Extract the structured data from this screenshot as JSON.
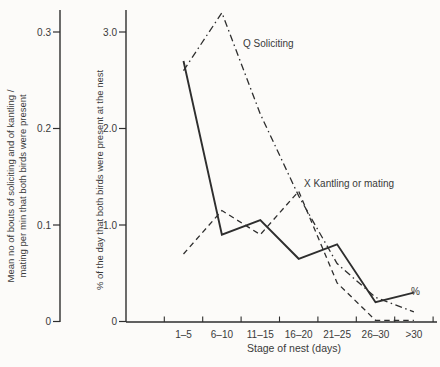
{
  "figure_title": "",
  "colors": {
    "ink": "#2e2e2e",
    "text": "#3a3a3a",
    "background": "#fcfbf9"
  },
  "chart_data": {
    "type": "line",
    "categories": [
      "1–5",
      "6–10",
      "11–15",
      "16–20",
      "21–25",
      "26–30",
      ">30"
    ],
    "xlabel": "Stage of nest (days)",
    "left_axis": {
      "label_line1": "Mean no of bouts of soliciting and of kantling /",
      "label_line2": "mating per min that both birds were present",
      "tick_labels": [
        "0.3",
        "0.2",
        "0.1",
        "0"
      ],
      "range": [
        0,
        0.33
      ]
    },
    "percent_axis": {
      "label": "% of the day that both birds were present at the nest",
      "tick_labels": [
        "3.0",
        "2.0",
        "1.0",
        "0"
      ],
      "tick_values": [
        3.0,
        2.0,
        1.0,
        0
      ],
      "range": [
        0,
        3.3
      ]
    },
    "grid": false,
    "legend_position": "inline-annotations",
    "series": [
      {
        "name": "% of the day that both birds were present at the nest",
        "annotation": "%",
        "style": "solid",
        "axis": "percent",
        "values": [
          2.7,
          0.9,
          1.05,
          0.65,
          0.8,
          0.2,
          0.3
        ]
      },
      {
        "name": "Q Soliciting",
        "annotation": "Q Soliciting",
        "style": "dash-dot",
        "axis": "left",
        "values": [
          2.6,
          3.2,
          2.15,
          1.3,
          0.6,
          0.25,
          0.1
        ]
      },
      {
        "name": "X Kantling or mating",
        "annotation": "X Kantling or mating",
        "style": "dashed",
        "axis": "left",
        "values": [
          0.7,
          1.15,
          0.9,
          1.35,
          0.4,
          0,
          0
        ]
      }
    ]
  }
}
